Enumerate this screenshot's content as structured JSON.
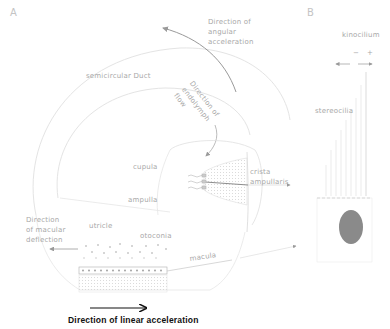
{
  "panels": {
    "a": "A",
    "b": "B"
  },
  "labels": {
    "angular_acceleration": "Direction of\nangular\nacceleration",
    "semicircular_duct": "semicircular Duct",
    "endolymph_flow": "Direction of\nendolymph\nflow",
    "cupula": "cupula",
    "crista_ampullaris": "crista\nampullaris",
    "ampulla": "ampulla",
    "macular_deflection": "Direction\nof macular\ndeflection",
    "utricle": "utricle",
    "otoconia": "otoconia",
    "macula": "macula",
    "linear_acceleration": "Direction of linear acceleration",
    "kinocilium": "kinocilium",
    "stereocilia": "stereocilia",
    "minus": "−",
    "plus": "+"
  },
  "colors": {
    "line": "#d8d8d8",
    "text": "#a8a8a8",
    "nucleus": "#8a8a8a",
    "black": "#111111"
  }
}
